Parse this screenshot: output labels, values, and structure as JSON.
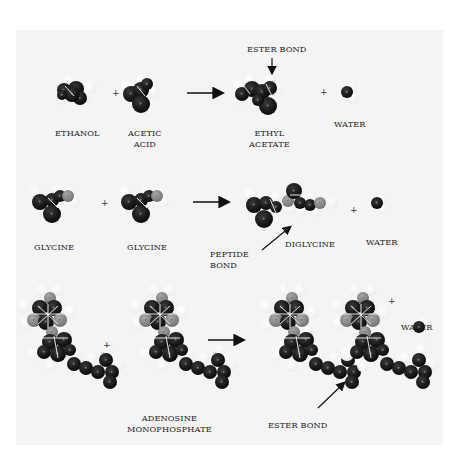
{
  "figure": {
    "rows": [
      {
        "id": "ester",
        "reactants": [
          {
            "name": "ethanol",
            "label_lines": [
              "ETHANOL"
            ]
          },
          {
            "name": "acetic-acid",
            "label_lines": [
              "ACETIC",
              "ACID"
            ]
          }
        ],
        "products": [
          {
            "name": "ethyl-acetate",
            "label_lines": [
              "ETHYL",
              "ACETATE"
            ]
          },
          {
            "name": "water",
            "label_lines": [
              "WATER"
            ]
          }
        ],
        "bond_annotation": "ESTER BOND"
      },
      {
        "id": "peptide",
        "reactants": [
          {
            "name": "glycine-1",
            "label_lines": [
              "GLYCINE"
            ]
          },
          {
            "name": "glycine-2",
            "label_lines": [
              "GLYCINE"
            ]
          }
        ],
        "products": [
          {
            "name": "diglycine",
            "label_lines": [
              "DIGLYCINE"
            ]
          },
          {
            "name": "water",
            "label_lines": [
              "WATER"
            ]
          }
        ],
        "bond_annotation_lines": [
          "PEPTIDE",
          "BOND"
        ]
      },
      {
        "id": "nucleotide",
        "reactants": [
          {
            "name": "adenosine-monophosphate",
            "label_lines": [
              "ADENOSINE",
              "MONOPHOSPHATE"
            ]
          }
        ],
        "products": [
          {
            "name": "water",
            "label_lines": [
              "WATER"
            ]
          }
        ],
        "bond_annotation": "ESTER BOND"
      }
    ],
    "plus_sign": "+",
    "atom_colors": {
      "carbon": "#111111",
      "hydrogen": "#ffffff",
      "nitrogen": "#8a8a8a",
      "oxygen": "#1a1a1a"
    }
  }
}
